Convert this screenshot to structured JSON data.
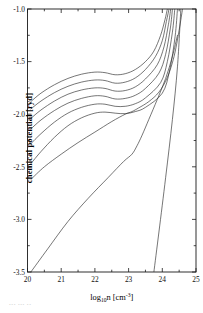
{
  "figure": {
    "name": "chemical-potential-vs-density-plot",
    "background_color": "#ffffff",
    "line_color": "#2b2b2b",
    "axis_color": "#1a1a1a"
  },
  "axes": {
    "x_label_main": "log",
    "x_label_sub": "10",
    "x_label_var": "n [cm",
    "x_label_sup": "-3",
    "x_label_close": "]",
    "y_label": "chemical potential [ryd]",
    "x_ticks": [
      "20",
      "21",
      "22",
      "23",
      "24",
      "25"
    ],
    "y_ticks": [
      "-1.0",
      "-1.5",
      "-2.0",
      "-2.5",
      "-3.0",
      "-3.5"
    ]
  },
  "footer": {
    "artifact_text": "••• ••• ••"
  },
  "chart_data": {
    "type": "line",
    "title": "",
    "subtitle": "",
    "xlabel": "log10 n [cm^-3]",
    "ylabel": "chemical potential [ryd]",
    "xlim": [
      20,
      25
    ],
    "ylim": [
      -3.5,
      -1.0
    ],
    "xticks": [
      20,
      21,
      22,
      23,
      24,
      25
    ],
    "yticks": [
      -3.5,
      -3.0,
      -2.5,
      -2.0,
      -1.5,
      -1.0
    ],
    "grid": false,
    "legend": null,
    "annotations": [],
    "series": [
      {
        "name": "curve-1-top",
        "x": [
          20.1,
          20.4,
          20.8,
          21.2,
          21.6,
          22.0,
          22.3,
          22.6,
          22.9,
          23.2,
          23.5,
          23.75,
          23.95,
          24.08,
          24.15
        ],
        "y": [
          -1.88,
          -1.8,
          -1.72,
          -1.66,
          -1.62,
          -1.6,
          -1.605,
          -1.625,
          -1.615,
          -1.575,
          -1.5,
          -1.4,
          -1.25,
          -1.1,
          -1.0
        ]
      },
      {
        "name": "curve-2",
        "x": [
          20.1,
          20.4,
          20.8,
          21.2,
          21.6,
          22.0,
          22.3,
          22.6,
          22.9,
          23.2,
          23.5,
          23.8,
          24.0,
          24.12,
          24.2
        ],
        "y": [
          -1.95,
          -1.875,
          -1.795,
          -1.735,
          -1.695,
          -1.675,
          -1.68,
          -1.705,
          -1.695,
          -1.655,
          -1.575,
          -1.45,
          -1.3,
          -1.12,
          -1.0
        ]
      },
      {
        "name": "curve-3",
        "x": [
          20.1,
          20.4,
          20.8,
          21.2,
          21.6,
          22.0,
          22.3,
          22.6,
          22.9,
          23.2,
          23.5,
          23.85,
          24.05,
          24.18,
          24.25
        ],
        "y": [
          -2.04,
          -1.96,
          -1.875,
          -1.81,
          -1.77,
          -1.75,
          -1.755,
          -1.78,
          -1.775,
          -1.74,
          -1.665,
          -1.53,
          -1.36,
          -1.15,
          -1.0
        ]
      },
      {
        "name": "curve-4",
        "x": [
          20.1,
          20.4,
          20.8,
          21.2,
          21.6,
          22.0,
          22.3,
          22.6,
          22.9,
          23.2,
          23.5,
          23.9,
          24.1,
          24.24,
          24.3
        ],
        "y": [
          -2.14,
          -2.055,
          -1.965,
          -1.895,
          -1.85,
          -1.825,
          -1.83,
          -1.855,
          -1.85,
          -1.82,
          -1.755,
          -1.61,
          -1.43,
          -1.18,
          -1.0
        ]
      },
      {
        "name": "curve-5",
        "x": [
          20.1,
          20.4,
          20.8,
          21.2,
          21.6,
          22.0,
          22.3,
          22.6,
          22.9,
          23.2,
          23.5,
          23.95,
          24.15,
          24.3,
          24.37
        ],
        "y": [
          -2.28,
          -2.185,
          -2.075,
          -1.99,
          -1.935,
          -1.905,
          -1.905,
          -1.925,
          -1.925,
          -1.9,
          -1.845,
          -1.7,
          -1.5,
          -1.22,
          -1.0
        ]
      },
      {
        "name": "curve-6-bottom-of-bundle",
        "x": [
          20.1,
          20.4,
          20.8,
          21.2,
          21.6,
          22.0,
          22.3,
          22.6,
          22.9,
          23.2,
          23.5,
          24.0,
          24.22,
          24.38,
          24.45
        ],
        "y": [
          -2.47,
          -2.355,
          -2.22,
          -2.11,
          -2.035,
          -1.99,
          -1.98,
          -1.99,
          -1.995,
          -1.975,
          -1.935,
          -1.8,
          -1.58,
          -1.26,
          -1.0
        ]
      },
      {
        "name": "curve-7-lowest-isotherm",
        "x": [
          20.1,
          20.5,
          21.0,
          21.5,
          22.0,
          22.5,
          22.9,
          23.1,
          23.3,
          23.6,
          23.9,
          24.15,
          24.35,
          24.5,
          24.6
        ],
        "y": [
          -2.62,
          -2.5,
          -2.38,
          -2.27,
          -2.17,
          -2.07,
          -2.0,
          -1.975,
          -1.94,
          -1.88,
          -1.79,
          -1.65,
          -1.45,
          -1.2,
          -1.0
        ]
      },
      {
        "name": "curve-8-steep-low-branch",
        "x": [
          20.1,
          20.6,
          21.2,
          21.8,
          22.4,
          22.85,
          23.1,
          23.25,
          23.4,
          23.6,
          23.85,
          24.1,
          24.3,
          24.45
        ],
        "y": [
          -3.5,
          -3.28,
          -3.02,
          -2.8,
          -2.6,
          -2.45,
          -2.38,
          -2.3,
          -2.2,
          -2.05,
          -1.86,
          -1.66,
          -1.45,
          -1.25
        ]
      },
      {
        "name": "curve-9-rightmost-steep-line",
        "x": [
          23.75,
          23.9,
          24.1,
          24.3,
          24.45,
          24.55
        ],
        "y": [
          -3.5,
          -3.12,
          -2.6,
          -2.05,
          -1.55,
          -1.0
        ]
      }
    ]
  }
}
